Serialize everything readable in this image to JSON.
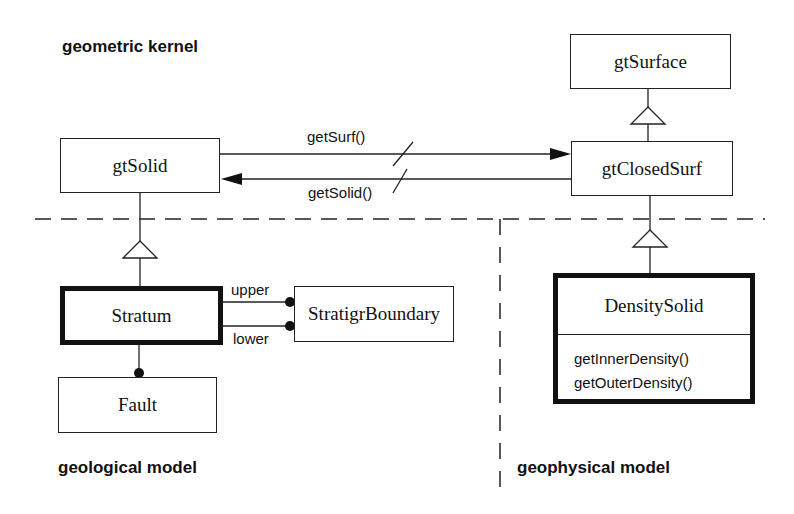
{
  "regions": {
    "geometric_kernel": "geometric kernel",
    "geological_model": "geological model",
    "geophysical_model": "geophysical model"
  },
  "classes": {
    "gtSurface": "gtSurface",
    "gtSolid": "gtSolid",
    "gtClosedSurf": "gtClosedSurf",
    "Stratum": "Stratum",
    "StratigrBoundary": "StratigrBoundary",
    "Fault": "Fault",
    "DensitySolid": {
      "name": "DensitySolid",
      "operations": [
        "getInnerDensity()",
        "getOuterDensity()"
      ]
    }
  },
  "associations": {
    "getSurf": "getSurf()",
    "getSolid": "getSolid()",
    "upper": "upper",
    "lower": "lower"
  },
  "colors": {
    "line": "#111111",
    "background": "#ffffff"
  }
}
